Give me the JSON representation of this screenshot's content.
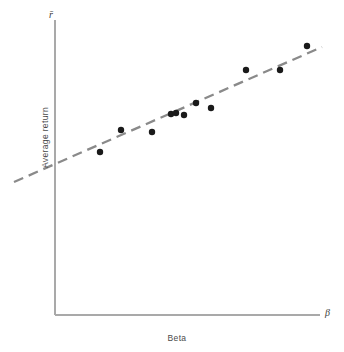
{
  "figure": {
    "width": 344,
    "height": 352,
    "background": "#ffffff"
  },
  "axes": {
    "y_symbol": "r̄",
    "x_symbol": "β",
    "y_title": "Average return",
    "x_title": "Beta",
    "axis_color": "#a9a9a9",
    "origin_x": 55,
    "origin_y": 315,
    "y_top": 20,
    "x_right": 320
  },
  "style": {
    "point_color": "#1a1a1a",
    "point_radius": 3.2,
    "line_color": "#8a8a8a",
    "line_width": 2.3,
    "dash_pattern": "10 6",
    "label_color": "#4a4a4a"
  },
  "chart_data": {
    "type": "scatter",
    "title": "",
    "xlabel": "Beta",
    "ylabel": "Average return",
    "x_axis_symbol": "β",
    "y_axis_symbol": "r̄",
    "grid": false,
    "legend": "none",
    "axis_ticks": "none",
    "xlim": [
      0,
      1
    ],
    "ylim": [
      0,
      1
    ],
    "points": [
      {
        "x": 0.17,
        "y": 0.553
      },
      {
        "x": 0.249,
        "y": 0.627
      },
      {
        "x": 0.366,
        "y": 0.621
      },
      {
        "x": 0.438,
        "y": 0.682
      },
      {
        "x": 0.487,
        "y": 0.678
      },
      {
        "x": 0.532,
        "y": 0.72
      },
      {
        "x": 0.588,
        "y": 0.702
      },
      {
        "x": 0.72,
        "y": 0.763
      },
      {
        "x": 0.846,
        "y": 0.763
      },
      {
        "x": 0.95,
        "y": 0.843
      },
      {
        "x": 0.452,
        "y": 0.686
      }
    ],
    "points_px": [
      {
        "x": 100,
        "y": 152
      },
      {
        "x": 121,
        "y": 130
      },
      {
        "x": 152,
        "y": 132
      },
      {
        "x": 171,
        "y": 114
      },
      {
        "x": 184,
        "y": 115
      },
      {
        "x": 196,
        "y": 103
      },
      {
        "x": 211,
        "y": 108
      },
      {
        "x": 246,
        "y": 70
      },
      {
        "x": 280,
        "y": 70
      },
      {
        "x": 307,
        "y": 46
      },
      {
        "x": 176,
        "y": 113
      }
    ],
    "fit_line": {
      "name": "fitted regression line",
      "style": "dashed",
      "x0_px": 14,
      "y0_px": 182,
      "x1_px": 322,
      "y1_px": 47,
      "slope_px": -0.4383
    }
  }
}
